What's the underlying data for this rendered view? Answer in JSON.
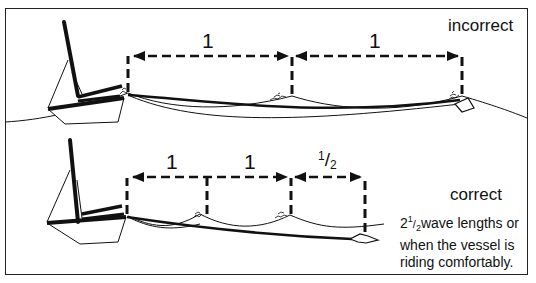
{
  "diagram": {
    "incorrect": {
      "title": "incorrect",
      "spans": [
        {
          "label": "1"
        },
        {
          "label": "1"
        }
      ]
    },
    "correct": {
      "title": "correct",
      "spans": [
        {
          "label": "1"
        },
        {
          "label": "1"
        },
        {
          "label_whole": "",
          "label_num": "1",
          "label_slash": "/",
          "label_den": "2"
        }
      ],
      "note_lead_whole": "2",
      "note_lead_num": "1",
      "note_lead_slash": "/",
      "note_lead_den": "2",
      "note_line1_rest": "wave lengths or",
      "note_line2": "when the vessel is",
      "note_line3": "riding comfortably."
    },
    "colors": {
      "ink": "#111111",
      "background": "#ffffff",
      "frame": "#222222"
    }
  }
}
